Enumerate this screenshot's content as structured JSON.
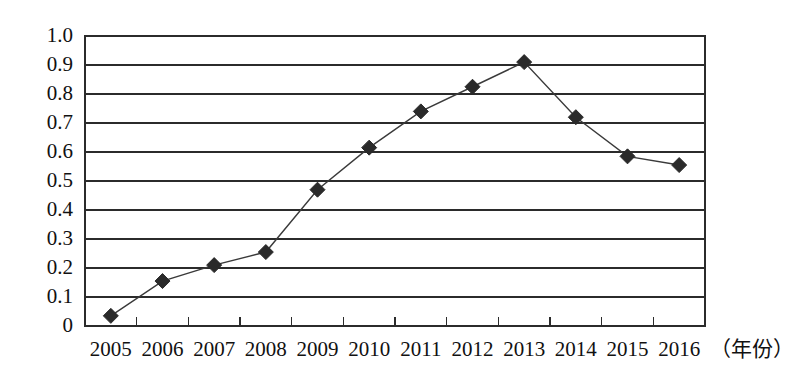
{
  "chart_data": {
    "type": "line",
    "title": "",
    "subtitle": "",
    "xlabel": "（年份）",
    "ylabel": "",
    "categories": [
      "2005",
      "2006",
      "2007",
      "2008",
      "2009",
      "2010",
      "2011",
      "2012",
      "2013",
      "2014",
      "2015",
      "2016"
    ],
    "values": [
      0.035,
      0.155,
      0.21,
      0.255,
      0.47,
      0.615,
      0.74,
      0.825,
      0.91,
      0.72,
      0.585,
      0.555
    ],
    "series": [
      {
        "name": "",
        "values": [
          0.035,
          0.155,
          0.21,
          0.255,
          0.47,
          0.615,
          0.74,
          0.825,
          0.91,
          0.72,
          0.585,
          0.555
        ]
      }
    ],
    "ylim": [
      0,
      1.0
    ],
    "yticks": [
      0,
      0.1,
      0.2,
      0.3,
      0.4,
      0.5,
      0.6,
      0.7,
      0.8,
      0.9,
      1.0
    ],
    "ytick_labels": [
      "0",
      "0.1",
      "0.2",
      "0.3",
      "0.4",
      "0.5",
      "0.6",
      "0.7",
      "0.8",
      "0.9",
      "1.0"
    ],
    "grid": true,
    "grid_axis": "y",
    "legend": false,
    "legend_position": "none",
    "marker": "diamond",
    "line_color": "#3a3a3a",
    "marker_color": "#2a2a2a",
    "grid_color": "#2b2b2b",
    "background_color": "#ffffff",
    "annotations": []
  },
  "axis": {
    "x_title": "（年份）"
  }
}
